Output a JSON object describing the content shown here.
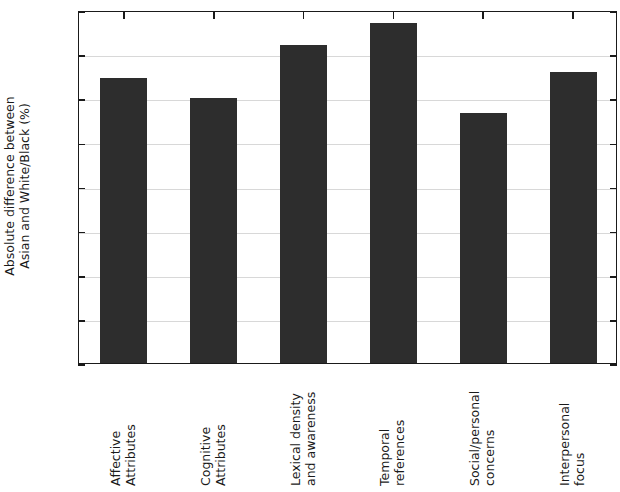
{
  "chart_data": {
    "type": "bar",
    "title": "",
    "xlabel": "",
    "ylabel": "Absolute difference between Asian and White/Black (%)",
    "ylabel_lines": [
      "Absolute difference between",
      "Asian and White/Black (%)"
    ],
    "ylim": [
      0,
      16
    ],
    "ytick_labels": [
      "0",
      "2",
      "4",
      "6",
      "8",
      "10",
      "12",
      "14",
      "16"
    ],
    "ytick_values": [
      0,
      2,
      4,
      6,
      8,
      10,
      12,
      14,
      16
    ],
    "grid": "horizontal",
    "legend": "none",
    "bar_color": "#2d2d2d",
    "categories": [
      "Affective Attributes",
      "Cognitive Attributes",
      "Lexical density and awareness",
      "Temporal references",
      "Social/personal concerns",
      "Interpersonal focus"
    ],
    "category_lines": [
      [
        "Affective",
        "Attributes"
      ],
      [
        "Cognitive",
        "Attributes"
      ],
      [
        "Lexical density",
        "and awareness"
      ],
      [
        "Temporal",
        "references"
      ],
      [
        "Social/personal",
        "concerns"
      ],
      [
        "Interpersonal",
        "focus"
      ]
    ],
    "values": [
      12.9,
      12.0,
      14.4,
      15.4,
      11.35,
      13.2
    ]
  }
}
